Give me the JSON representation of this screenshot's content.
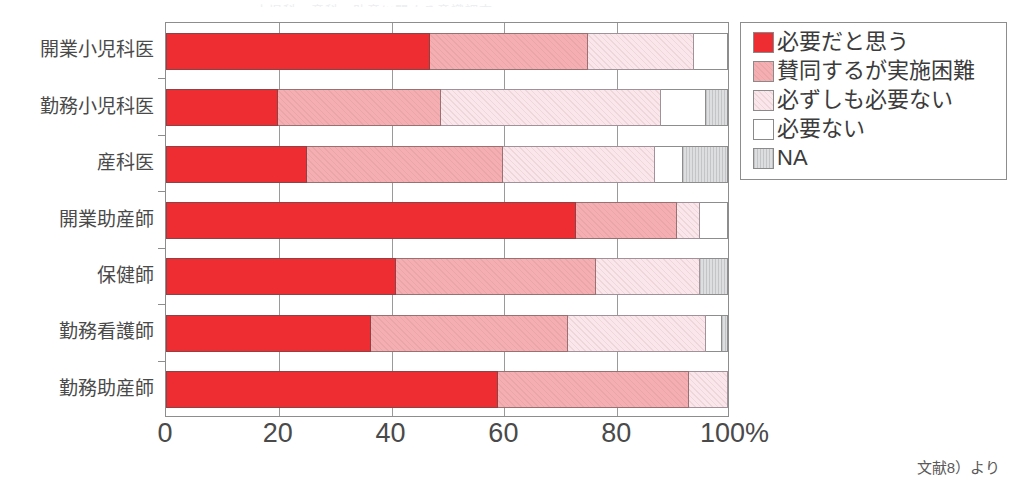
{
  "title_trace": "小児科・産科・助産に関する意識調査",
  "source_note": "文献8）より",
  "legend": {
    "items": [
      {
        "label": "必要だと思う",
        "color": "#ee2d32",
        "icon": "legend-swatch-red"
      },
      {
        "label": "賛同するが実施困難",
        "color": "#f5afb2",
        "icon": "legend-swatch-pink"
      },
      {
        "label": "必ずしも必要ない",
        "color": "#fbe7eb",
        "icon": "legend-swatch-lightpink"
      },
      {
        "label": "必要ない",
        "color": "#ffffff",
        "icon": "legend-swatch-white"
      },
      {
        "label": "NA",
        "color": "#dddee0",
        "icon": "legend-swatch-gray"
      }
    ]
  },
  "chart_data": {
    "type": "bar",
    "orientation": "horizontal",
    "stacked": true,
    "normalized": true,
    "title": "",
    "xlabel": "",
    "ylabel": "",
    "xlim": [
      0,
      100
    ],
    "xticks": [
      0,
      20,
      40,
      60,
      80,
      100
    ],
    "xtick_labels": [
      "0",
      "20",
      "40",
      "60",
      "80",
      "100%"
    ],
    "grid": true,
    "legend_position": "right",
    "categories": [
      "開業小児科医",
      "勤務小児科医",
      "産科医",
      "開業助産師",
      "保健師",
      "勤務看護師",
      "勤務助産師"
    ],
    "series": [
      {
        "name": "必要だと思う",
        "color": "#ee2d32",
        "values": [
          47.0,
          20.0,
          25.0,
          73.0,
          41.0,
          36.5,
          59.0
        ]
      },
      {
        "name": "賛同するが実施困難",
        "color": "#f5afb2",
        "values": [
          28.0,
          29.0,
          35.0,
          18.0,
          35.5,
          35.0,
          34.0
        ]
      },
      {
        "name": "必ずしも必要ない",
        "color": "#fbe7eb",
        "values": [
          19.0,
          39.0,
          27.0,
          4.0,
          18.5,
          24.5,
          7.0
        ]
      },
      {
        "name": "必要ない",
        "color": "#ffffff",
        "values": [
          6.0,
          8.0,
          5.0,
          5.0,
          0.0,
          3.0,
          0.0
        ]
      },
      {
        "name": "NA",
        "color": "#dddee0",
        "values": [
          0.0,
          4.0,
          8.0,
          0.0,
          5.0,
          1.0,
          0.0
        ]
      }
    ]
  }
}
